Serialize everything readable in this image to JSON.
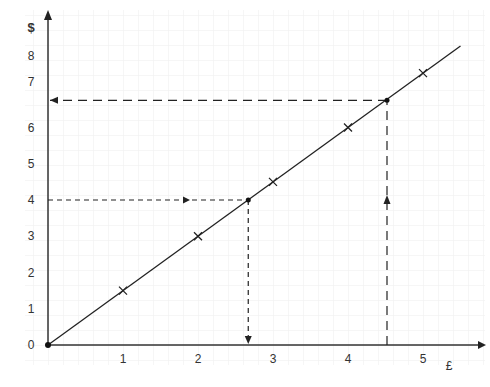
{
  "chart_data": {
    "type": "line",
    "title": "",
    "xlabel": "£",
    "ylabel": "$",
    "xlim": [
      0,
      5.5
    ],
    "ylim": [
      0,
      8.5
    ],
    "x_ticks": [
      "1",
      "2",
      "3",
      "4",
      "5"
    ],
    "y_ticks": [
      "0",
      "1",
      "2",
      "3",
      "4",
      "5",
      "6",
      "7",
      "8"
    ],
    "grid": true,
    "series": [
      {
        "name": "conversion line",
        "x": [
          0,
          5.5
        ],
        "y": [
          0,
          8.25
        ]
      },
      {
        "name": "plotted points",
        "marker": "x",
        "x": [
          1,
          2,
          3,
          4,
          5
        ],
        "y": [
          1.5,
          3,
          4.5,
          6,
          7.5
        ]
      }
    ],
    "annotations": [
      {
        "type": "dashed-arrow",
        "from": [
          0,
          4
        ],
        "to": [
          2.67,
          4
        ],
        "then_down_to": [
          2.67,
          0
        ],
        "point": [
          2.67,
          4
        ]
      },
      {
        "type": "dashed-arrow",
        "from": [
          4.5,
          0
        ],
        "to": [
          4.5,
          6.75
        ],
        "then_left_to": [
          0,
          6.75
        ],
        "point": [
          4.5,
          6.75
        ]
      }
    ]
  }
}
